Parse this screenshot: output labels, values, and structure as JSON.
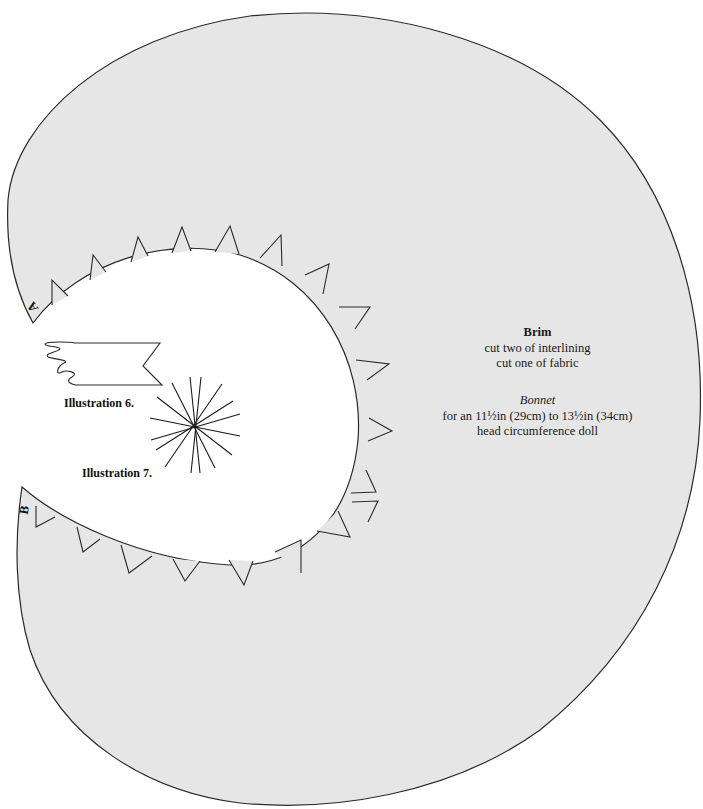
{
  "pattern": {
    "piece_name": "Brim",
    "instructions": [
      "cut two of interlining",
      "cut one of fabric"
    ],
    "garment": "Bonnet",
    "size_line_1": "for an 11½in (29cm) to 13½in (34cm)",
    "size_line_2": "head circumference doll",
    "markers": {
      "a": "A",
      "b": "B"
    },
    "colors": {
      "fill": "#e6e6e6",
      "stroke": "#2a2a2a",
      "background": "#ffffff"
    },
    "notch_count": 20
  },
  "illustrations": [
    {
      "label": "Illustration 6.",
      "depicts": "folded-strip-icon"
    },
    {
      "label": "Illustration 7.",
      "depicts": "starburst-icon"
    }
  ]
}
